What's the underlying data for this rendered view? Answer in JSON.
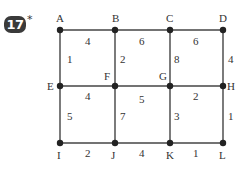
{
  "problem": {
    "number": "17",
    "marker": "*"
  },
  "nodes": [
    {
      "id": "A",
      "x": 60,
      "y": 30,
      "lx": 56,
      "ly": 22
    },
    {
      "id": "B",
      "x": 115,
      "y": 30,
      "lx": 112,
      "ly": 22
    },
    {
      "id": "C",
      "x": 170,
      "y": 30,
      "lx": 166,
      "ly": 22
    },
    {
      "id": "D",
      "x": 223,
      "y": 30,
      "lx": 219,
      "ly": 22
    },
    {
      "id": "E",
      "x": 60,
      "y": 86,
      "lx": 47,
      "ly": 90
    },
    {
      "id": "F",
      "x": 115,
      "y": 86,
      "lx": 104,
      "ly": 80
    },
    {
      "id": "G",
      "x": 170,
      "y": 86,
      "lx": 159,
      "ly": 80
    },
    {
      "id": "H",
      "x": 223,
      "y": 86,
      "lx": 227,
      "ly": 90
    },
    {
      "id": "I",
      "x": 60,
      "y": 143,
      "lx": 57,
      "ly": 159
    },
    {
      "id": "J",
      "x": 115,
      "y": 143,
      "lx": 111,
      "ly": 159
    },
    {
      "id": "K",
      "x": 170,
      "y": 143,
      "lx": 166,
      "ly": 159
    },
    {
      "id": "L",
      "x": 223,
      "y": 143,
      "lx": 219,
      "ly": 159
    }
  ],
  "edges": [
    {
      "from": "A",
      "to": "B",
      "weight": "4",
      "lx": 85,
      "ly": 45
    },
    {
      "from": "B",
      "to": "C",
      "weight": "6",
      "lx": 139,
      "ly": 45
    },
    {
      "from": "C",
      "to": "D",
      "weight": "6",
      "lx": 193,
      "ly": 45
    },
    {
      "from": "A",
      "to": "E",
      "weight": "1",
      "lx": 67,
      "ly": 63
    },
    {
      "from": "B",
      "to": "F",
      "weight": "2",
      "lx": 120,
      "ly": 63
    },
    {
      "from": "C",
      "to": "G",
      "weight": "8",
      "lx": 174,
      "ly": 63
    },
    {
      "from": "D",
      "to": "H",
      "weight": "4",
      "lx": 228,
      "ly": 63
    },
    {
      "from": "E",
      "to": "F",
      "weight": "4",
      "lx": 85,
      "ly": 100
    },
    {
      "from": "F",
      "to": "G",
      "weight": "5",
      "lx": 139,
      "ly": 103
    },
    {
      "from": "G",
      "to": "H",
      "weight": "2",
      "lx": 193,
      "ly": 100
    },
    {
      "from": "E",
      "to": "I",
      "weight": "5",
      "lx": 67,
      "ly": 120
    },
    {
      "from": "F",
      "to": "J",
      "weight": "7",
      "lx": 120,
      "ly": 120
    },
    {
      "from": "G",
      "to": "K",
      "weight": "3",
      "lx": 174,
      "ly": 120
    },
    {
      "from": "H",
      "to": "L",
      "weight": "1",
      "lx": 228,
      "ly": 120
    },
    {
      "from": "I",
      "to": "J",
      "weight": "2",
      "lx": 85,
      "ly": 157
    },
    {
      "from": "J",
      "to": "K",
      "weight": "4",
      "lx": 139,
      "ly": 157
    },
    {
      "from": "K",
      "to": "L",
      "weight": "1",
      "lx": 193,
      "ly": 157
    }
  ]
}
